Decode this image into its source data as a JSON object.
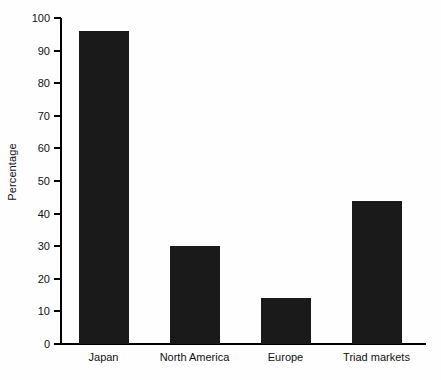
{
  "chart_data": {
    "type": "bar",
    "title": "",
    "xlabel": "",
    "ylabel": "Percentage",
    "categories": [
      "Japan",
      "North America",
      "Europe",
      "Triad markets"
    ],
    "values": [
      96,
      30,
      14,
      44
    ],
    "ylim": [
      0,
      100
    ],
    "ytick_labels": [
      "0",
      "10",
      "20",
      "30",
      "40",
      "50",
      "60",
      "70",
      "80",
      "90",
      "100"
    ],
    "ytick_values": [
      0,
      10,
      20,
      30,
      40,
      50,
      60,
      70,
      80,
      90,
      100
    ],
    "grid": false,
    "legend": null,
    "bar_color": "#1a1a1a",
    "axis_color": "#000000",
    "background_color": "#fefefe",
    "text_color": "#111111"
  }
}
